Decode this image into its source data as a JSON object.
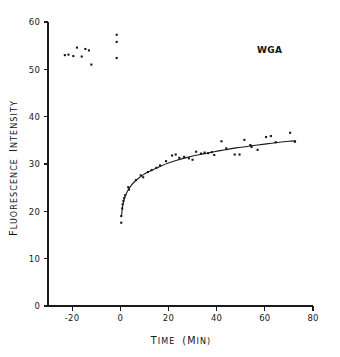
{
  "chart_data": {
    "type": "scatter",
    "title": "",
    "subtitle": "",
    "xlabel": "TIME (MIN)",
    "ylabel": "FLUORESCENCE INTENSITY",
    "xlabel_parts": {
      "word1_cap": "T",
      "word1_rest": "IME",
      "word2_cap": "(M",
      "word2_rest": "IN)"
    },
    "ylabel_parts": {
      "word1_cap": "F",
      "word1_rest": "LUORESCENCE",
      "word2_cap": "I",
      "word2_rest": "NTENSITY"
    },
    "xlim": [
      -30,
      80
    ],
    "ylim": [
      0,
      60
    ],
    "xticks": [
      -20,
      0,
      20,
      40,
      60,
      80
    ],
    "xticklabels": [
      "-20",
      "0",
      "20",
      "40",
      "60",
      "80"
    ],
    "yticks": [
      0,
      10,
      20,
      30,
      40,
      50,
      60
    ],
    "yticklabels": [
      "0",
      "10",
      "20",
      "30",
      "40",
      "50",
      "60"
    ],
    "grid": false,
    "legend": "none",
    "marker": "square",
    "marker_color": "#161616",
    "curve_color": "#1a1a1a",
    "annotations": [
      {
        "text": "WGA",
        "x": 62,
        "y": 53.5
      }
    ],
    "series": [
      {
        "name": "Baseline fluorescence (pre-addition)",
        "points": [
          {
            "x": -23.0,
            "y": 53.0
          },
          {
            "x": -21.5,
            "y": 53.1
          },
          {
            "x": -19.5,
            "y": 52.8
          },
          {
            "x": -18.0,
            "y": 54.6
          },
          {
            "x": -16.0,
            "y": 52.7
          },
          {
            "x": -14.5,
            "y": 54.3
          },
          {
            "x": -13.0,
            "y": 54.0
          },
          {
            "x": -12.0,
            "y": 51.0
          },
          {
            "x": -1.5,
            "y": 57.3
          },
          {
            "x": -1.5,
            "y": 55.8
          },
          {
            "x": -1.5,
            "y": 52.4
          }
        ]
      },
      {
        "name": "Fluorescence after WGA addition",
        "points": [
          {
            "x": 0.4,
            "y": 17.6
          },
          {
            "x": 0.4,
            "y": 19.0
          },
          {
            "x": 0.8,
            "y": 20.6
          },
          {
            "x": 1.0,
            "y": 21.5
          },
          {
            "x": 1.3,
            "y": 22.2
          },
          {
            "x": 1.6,
            "y": 22.8
          },
          {
            "x": 2.0,
            "y": 23.4
          },
          {
            "x": 3.3,
            "y": 25.1
          },
          {
            "x": 3.6,
            "y": 24.6
          },
          {
            "x": 6.5,
            "y": 26.6
          },
          {
            "x": 8.5,
            "y": 27.6
          },
          {
            "x": 9.5,
            "y": 27.2
          },
          {
            "x": 11.5,
            "y": 28.3
          },
          {
            "x": 13.0,
            "y": 28.7
          },
          {
            "x": 15.0,
            "y": 29.2
          },
          {
            "x": 16.5,
            "y": 29.7
          },
          {
            "x": 19.0,
            "y": 30.6
          },
          {
            "x": 21.5,
            "y": 31.8
          },
          {
            "x": 23.0,
            "y": 32.0
          },
          {
            "x": 24.5,
            "y": 31.3
          },
          {
            "x": 26.5,
            "y": 31.5
          },
          {
            "x": 28.5,
            "y": 31.2
          },
          {
            "x": 30.0,
            "y": 30.9
          },
          {
            "x": 31.5,
            "y": 32.6
          },
          {
            "x": 33.5,
            "y": 32.2
          },
          {
            "x": 35.0,
            "y": 32.4
          },
          {
            "x": 36.5,
            "y": 32.3
          },
          {
            "x": 38.0,
            "y": 32.5
          },
          {
            "x": 39.0,
            "y": 31.9
          },
          {
            "x": 42.0,
            "y": 34.8
          },
          {
            "x": 44.0,
            "y": 33.3
          },
          {
            "x": 47.5,
            "y": 32.0
          },
          {
            "x": 49.5,
            "y": 32.0
          },
          {
            "x": 51.5,
            "y": 35.1
          },
          {
            "x": 54.0,
            "y": 34.0
          },
          {
            "x": 54.5,
            "y": 33.6
          },
          {
            "x": 57.0,
            "y": 33.0
          },
          {
            "x": 60.5,
            "y": 35.7
          },
          {
            "x": 62.5,
            "y": 35.9
          },
          {
            "x": 64.5,
            "y": 34.6
          },
          {
            "x": 70.5,
            "y": 36.6
          },
          {
            "x": 72.5,
            "y": 34.7
          }
        ]
      }
    ],
    "fit_curve": {
      "name": "Fitted association curve",
      "points": [
        {
          "x": 0.5,
          "y": 18.9
        },
        {
          "x": 1.0,
          "y": 21.2
        },
        {
          "x": 1.6,
          "y": 22.5
        },
        {
          "x": 2.4,
          "y": 23.6
        },
        {
          "x": 3.4,
          "y": 24.6
        },
        {
          "x": 4.6,
          "y": 25.5
        },
        {
          "x": 6.0,
          "y": 26.3
        },
        {
          "x": 7.6,
          "y": 27.0
        },
        {
          "x": 9.5,
          "y": 27.7
        },
        {
          "x": 11.5,
          "y": 28.3
        },
        {
          "x": 14.0,
          "y": 28.9
        },
        {
          "x": 17.0,
          "y": 29.6
        },
        {
          "x": 20.0,
          "y": 30.2
        },
        {
          "x": 23.5,
          "y": 30.8
        },
        {
          "x": 27.0,
          "y": 31.3
        },
        {
          "x": 31.0,
          "y": 31.8
        },
        {
          "x": 35.0,
          "y": 32.2
        },
        {
          "x": 39.0,
          "y": 32.6
        },
        {
          "x": 43.5,
          "y": 33.0
        },
        {
          "x": 48.0,
          "y": 33.4
        },
        {
          "x": 52.5,
          "y": 33.7
        },
        {
          "x": 57.0,
          "y": 34.0
        },
        {
          "x": 61.5,
          "y": 34.3
        },
        {
          "x": 66.0,
          "y": 34.6
        },
        {
          "x": 70.0,
          "y": 34.8
        },
        {
          "x": 73.0,
          "y": 34.9
        }
      ]
    }
  }
}
